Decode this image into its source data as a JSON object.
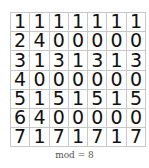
{
  "table": {
    "rows": [
      [
        "1",
        "1",
        "1",
        "1",
        "1",
        "1",
        "1"
      ],
      [
        "2",
        "4",
        "0",
        "0",
        "0",
        "0",
        "0"
      ],
      [
        "3",
        "1",
        "3",
        "1",
        "3",
        "1",
        "3"
      ],
      [
        "4",
        "0",
        "0",
        "0",
        "0",
        "0",
        "0"
      ],
      [
        "5",
        "1",
        "5",
        "1",
        "5",
        "1",
        "5"
      ],
      [
        "6",
        "4",
        "0",
        "0",
        "0",
        "0",
        "0"
      ],
      [
        "7",
        "1",
        "7",
        "1",
        "7",
        "1",
        "7"
      ]
    ]
  },
  "caption": "mod = 8"
}
